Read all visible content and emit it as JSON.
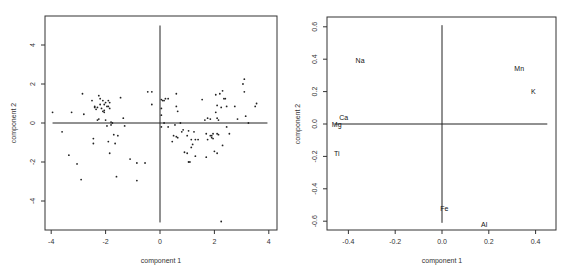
{
  "chart_data": [
    {
      "type": "scatter",
      "title": "",
      "xlabel": "component 1",
      "ylabel": "component 2",
      "xlim": [
        -4.2,
        4.3
      ],
      "ylim": [
        -5.5,
        5.4
      ],
      "xticks": [
        -4,
        -2,
        0,
        2,
        4
      ],
      "yticks": [
        -4,
        -2,
        0,
        2,
        4
      ],
      "xtick_labels": [
        "-4",
        "-2",
        "0",
        "2",
        "4"
      ],
      "ytick_labels": [
        "-4",
        "-2",
        "0",
        "2",
        "4"
      ],
      "grid": false,
      "reference_lines": {
        "vertical_x": 0,
        "vertical_range": [
          -5.1,
          5.0
        ],
        "horizontal_y": 0,
        "horizontal_range": [
          -3.95,
          3.95
        ]
      },
      "points": [
        [
          -3.95,
          0.55
        ],
        [
          -3.6,
          -0.45
        ],
        [
          -3.35,
          -1.65
        ],
        [
          -3.25,
          0.55
        ],
        [
          -3.05,
          -2.1
        ],
        [
          -2.9,
          -2.9
        ],
        [
          -2.85,
          1.5
        ],
        [
          -2.8,
          0.45
        ],
        [
          -2.5,
          1.15
        ],
        [
          -2.45,
          -1.05
        ],
        [
          -2.45,
          -0.8
        ],
        [
          -2.4,
          0.85
        ],
        [
          -2.4,
          0.8
        ],
        [
          -2.35,
          0.7
        ],
        [
          -2.3,
          0.15
        ],
        [
          -2.25,
          0.2
        ],
        [
          -2.25,
          1.4
        ],
        [
          -2.2,
          1.25
        ],
        [
          -2.2,
          0.95
        ],
        [
          -2.15,
          0.75
        ],
        [
          -2.1,
          1.15
        ],
        [
          -2.1,
          0.6
        ],
        [
          -2.05,
          0.95
        ],
        [
          -2.05,
          0.55
        ],
        [
          -2.0,
          1.05
        ],
        [
          -2.0,
          0.15
        ],
        [
          -1.95,
          0.85
        ],
        [
          -1.95,
          -0.15
        ],
        [
          -1.9,
          1.15
        ],
        [
          -1.9,
          0.85
        ],
        [
          -1.9,
          -0.95
        ],
        [
          -1.85,
          1.05
        ],
        [
          -1.85,
          0.75
        ],
        [
          -1.8,
          -0.1
        ],
        [
          -1.8,
          0.05
        ],
        [
          -1.75,
          0.0
        ],
        [
          -1.7,
          -0.6
        ],
        [
          -1.65,
          -1.05
        ],
        [
          -1.55,
          -0.65
        ],
        [
          -1.45,
          1.3
        ],
        [
          -1.85,
          -1.55
        ],
        [
          -1.6,
          -2.75
        ],
        [
          -1.35,
          0.25
        ],
        [
          -1.3,
          -0.15
        ],
        [
          -1.1,
          -1.85
        ],
        [
          -0.85,
          -2.05
        ],
        [
          -0.85,
          -2.95
        ],
        [
          -0.55,
          -2.05
        ],
        [
          -0.45,
          1.6
        ],
        [
          -0.3,
          1.6
        ],
        [
          -0.3,
          0.95
        ],
        [
          0.05,
          1.2
        ],
        [
          0.1,
          1.15
        ],
        [
          0.15,
          1.15
        ],
        [
          0.2,
          1.25
        ],
        [
          0.3,
          1.25
        ],
        [
          0.05,
          0.75
        ],
        [
          0.05,
          0.4
        ],
        [
          0.05,
          -0.2
        ],
        [
          0.15,
          0.0
        ],
        [
          0.3,
          -0.2
        ],
        [
          0.6,
          1.5
        ],
        [
          0.6,
          0.85
        ],
        [
          0.65,
          0.6
        ],
        [
          0.55,
          -0.1
        ],
        [
          0.6,
          -0.7
        ],
        [
          0.65,
          -0.75
        ],
        [
          0.45,
          -0.95
        ],
        [
          0.5,
          -0.65
        ],
        [
          0.75,
          0.0
        ],
        [
          0.8,
          -0.45
        ],
        [
          0.85,
          -0.35
        ],
        [
          0.9,
          -1.5
        ],
        [
          1.0,
          -1.55
        ],
        [
          1.0,
          -0.65
        ],
        [
          1.05,
          -0.4
        ],
        [
          1.05,
          -2.0
        ],
        [
          1.1,
          -2.0
        ],
        [
          1.15,
          -1.25
        ],
        [
          1.15,
          -0.85
        ],
        [
          1.2,
          -1.1
        ],
        [
          1.25,
          -0.45
        ],
        [
          1.3,
          -0.85
        ],
        [
          1.3,
          -1.7
        ],
        [
          1.4,
          -0.85
        ],
        [
          1.55,
          1.2
        ],
        [
          1.65,
          0.15
        ],
        [
          1.7,
          -0.55
        ],
        [
          1.7,
          -1.75
        ],
        [
          1.75,
          -0.85
        ],
        [
          1.75,
          0.25
        ],
        [
          1.85,
          0.2
        ],
        [
          1.85,
          -0.65
        ],
        [
          1.9,
          -0.65
        ],
        [
          1.9,
          -0.75
        ],
        [
          1.95,
          -0.55
        ],
        [
          1.95,
          -0.8
        ],
        [
          2.0,
          -1.45
        ],
        [
          2.05,
          1.45
        ],
        [
          2.05,
          0.55
        ],
        [
          2.1,
          0.25
        ],
        [
          2.1,
          0.9
        ],
        [
          2.1,
          -0.55
        ],
        [
          2.15,
          0.15
        ],
        [
          2.1,
          -1.55
        ],
        [
          2.15,
          -0.6
        ],
        [
          2.2,
          1.5
        ],
        [
          2.25,
          0.8
        ],
        [
          2.3,
          1.65
        ],
        [
          2.3,
          -1.15
        ],
        [
          2.35,
          1.25
        ],
        [
          2.4,
          1.25
        ],
        [
          2.45,
          -0.2
        ],
        [
          2.45,
          0.85
        ],
        [
          2.55,
          -0.55
        ],
        [
          2.75,
          0.85
        ],
        [
          2.85,
          0.2
        ],
        [
          3.05,
          2.0
        ],
        [
          3.1,
          2.25
        ],
        [
          3.1,
          1.6
        ],
        [
          3.15,
          0.35
        ],
        [
          3.25,
          0.0
        ],
        [
          3.5,
          0.85
        ],
        [
          3.55,
          1.0
        ],
        [
          2.25,
          -5.05
        ],
        [
          -2.05,
          0.65
        ],
        [
          -2.3,
          0.8
        ]
      ]
    },
    {
      "type": "scatter",
      "title": "",
      "xlabel": "component 1",
      "ylabel": "component 2",
      "xlim": [
        -0.49,
        0.49
      ],
      "ylim": [
        -0.65,
        0.66
      ],
      "xticks": [
        -0.4,
        -0.2,
        0.0,
        0.2,
        0.4
      ],
      "yticks": [
        -0.6,
        -0.4,
        -0.2,
        0.0,
        0.2,
        0.4,
        0.6
      ],
      "xtick_labels": [
        "-0.4",
        "-0.2",
        "0.0",
        "0.2",
        "0.4"
      ],
      "ytick_labels": [
        "-0.6",
        "-0.4",
        "-0.2",
        "0.0",
        "0.2",
        "0.4",
        "0.6"
      ],
      "grid": false,
      "reference_lines": {
        "vertical_x": 0.0,
        "vertical_range": [
          -0.61,
          0.61
        ],
        "horizontal_y": 0.0,
        "horizontal_range": [
          -0.46,
          0.45
        ]
      },
      "labeled_points": [
        {
          "label": "Na",
          "x": -0.35,
          "y": 0.39
        },
        {
          "label": "Mn",
          "x": 0.33,
          "y": 0.34
        },
        {
          "label": "K",
          "x": 0.39,
          "y": 0.2
        },
        {
          "label": "Ca",
          "x": -0.42,
          "y": 0.04
        },
        {
          "label": "Mg",
          "x": -0.45,
          "y": 0.0
        },
        {
          "label": "Ti",
          "x": -0.45,
          "y": -0.18
        },
        {
          "label": "Fe",
          "x": 0.01,
          "y": -0.52
        },
        {
          "label": "Al",
          "x": 0.18,
          "y": -0.62
        }
      ]
    }
  ],
  "plots": {
    "left": {
      "xlabel": "component 1",
      "ylabel": "component 2",
      "xticks": [
        "-4",
        "-2",
        "0",
        "2",
        "4"
      ],
      "yticks": [
        "4",
        "2",
        "0",
        "-2",
        "-4"
      ]
    },
    "right": {
      "xlabel": "component 1",
      "ylabel": "component 2",
      "xticks": [
        "-0.4",
        "-0.2",
        "0.0",
        "0.2",
        "0.4"
      ],
      "yticks": [
        "0.6",
        "0.4",
        "0.2",
        "0.0",
        "-0.2",
        "-0.4",
        "-0.6"
      ]
    }
  },
  "colors": {
    "frame": "#333333",
    "points": "#222222",
    "background": "#ffffff"
  }
}
